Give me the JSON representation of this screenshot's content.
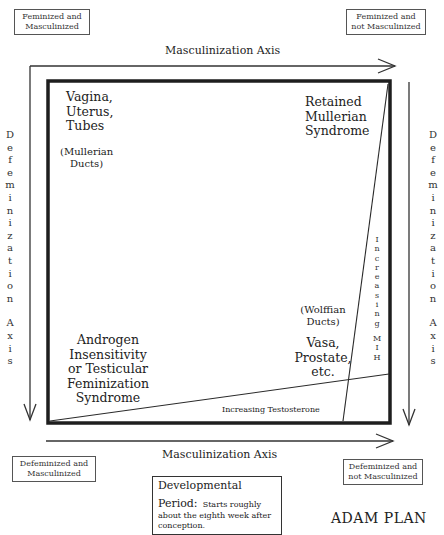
{
  "diagram": {
    "title": "ADAM PLAN",
    "corner_labels": {
      "top_left": [
        "Feminized and",
        "Masculinized"
      ],
      "top_right": [
        "Feminized and",
        "not Masculinized"
      ],
      "bottom_left": [
        "Defeminized and",
        "Masculinized"
      ],
      "bottom_right": [
        "Defeminized and",
        "not Masculinized"
      ]
    },
    "axes": {
      "top": "Masculinization Axis",
      "bottom": "Masculinization Axis",
      "left_letters": [
        "D",
        "e",
        "f",
        "e",
        "m",
        "i",
        "n",
        "i",
        "z",
        "a",
        "t",
        "i",
        "o",
        "n",
        "",
        "A",
        "x",
        "i",
        "s"
      ],
      "right_letters": [
        "D",
        "e",
        "f",
        "e",
        "m",
        "i",
        "n",
        "i",
        "z",
        "a",
        "t",
        "i",
        "o",
        "n",
        "",
        "A",
        "x",
        "i",
        "s"
      ],
      "left_label": "Defemination Axis",
      "right_label": "Defeminization Axis"
    },
    "regions": {
      "top_left": {
        "lines": [
          "Vagina,",
          "Uterus,",
          "Tubes"
        ],
        "sub": [
          "(Mullerian",
          "Ducts)"
        ]
      },
      "top_right": {
        "lines": [
          "Retained",
          "Mullerian",
          "Syndrome"
        ]
      },
      "bottom_right": {
        "sub": [
          "(Wolffian",
          "Ducts)"
        ],
        "lines": [
          "Vasa,",
          "Prostate,",
          "etc."
        ]
      },
      "bottom_left": {
        "lines": [
          "Androgen",
          "Insensitivity",
          "or Testicular",
          "Feminization",
          "Syndrome"
        ]
      }
    },
    "gradients": {
      "testosterone": "Increasing Testosterone",
      "mih_letters": [
        "I",
        "n",
        "c",
        "r",
        "e",
        "a",
        "s",
        "i",
        "n",
        "g",
        "",
        "M",
        "I",
        "H"
      ]
    },
    "period_box": {
      "heading": "Developmental",
      "label": "Period:",
      "text_inline": "Starts roughly",
      "text_rest": "about the eighth week after conception."
    },
    "colors": {
      "line": "#2a2a2a",
      "thick_border": "#1e1e1e",
      "background": "#ffffff"
    }
  }
}
